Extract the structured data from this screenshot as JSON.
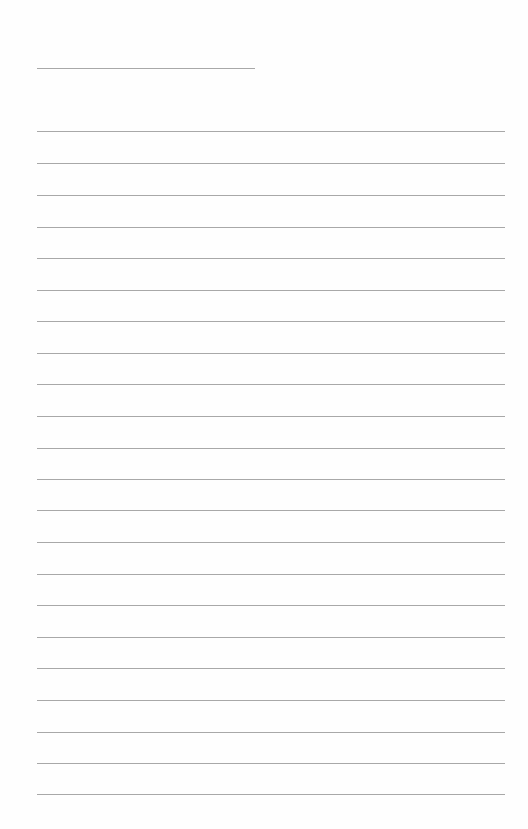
{
  "page": {
    "type": "lined-paper",
    "background_color": "#fefefe",
    "line_color": "#a8a8a8",
    "title_line": {
      "text": ""
    },
    "writing_lines": [
      {
        "y": 131,
        "text": ""
      },
      {
        "y": 163,
        "text": ""
      },
      {
        "y": 195,
        "text": ""
      },
      {
        "y": 227,
        "text": ""
      },
      {
        "y": 258,
        "text": ""
      },
      {
        "y": 290,
        "text": ""
      },
      {
        "y": 321,
        "text": ""
      },
      {
        "y": 353,
        "text": ""
      },
      {
        "y": 384,
        "text": ""
      },
      {
        "y": 416,
        "text": ""
      },
      {
        "y": 448,
        "text": ""
      },
      {
        "y": 479,
        "text": ""
      },
      {
        "y": 510,
        "text": ""
      },
      {
        "y": 542,
        "text": ""
      },
      {
        "y": 574,
        "text": ""
      },
      {
        "y": 605,
        "text": ""
      },
      {
        "y": 637,
        "text": ""
      },
      {
        "y": 668,
        "text": ""
      },
      {
        "y": 700,
        "text": ""
      },
      {
        "y": 732,
        "text": ""
      },
      {
        "y": 763,
        "text": ""
      },
      {
        "y": 794,
        "text": ""
      }
    ]
  }
}
